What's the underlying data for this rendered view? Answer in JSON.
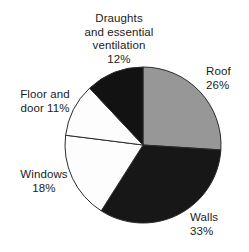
{
  "chart_data": {
    "type": "pie",
    "title": "",
    "subtitle": "",
    "xlabel": "",
    "ylabel": "",
    "legend_position": "none",
    "grid": false,
    "units": "%",
    "start_angle_deg": 0,
    "direction": "clockwise",
    "total": 100,
    "categories": [
      "Roof",
      "Walls",
      "Windows",
      "Floor and door",
      "Draughts and essential ventilation"
    ],
    "values": [
      26,
      33,
      18,
      11,
      12
    ],
    "slices": [
      {
        "name": "Roof",
        "value": 26,
        "value_text": "26%",
        "label_lines": [
          "Roof",
          "26%"
        ],
        "fill": "#979797",
        "stroke": "#2b2b2b",
        "start_deg": 0,
        "end_deg": 93.6
      },
      {
        "name": "Walls",
        "value": 33,
        "value_text": "33%",
        "label_lines": [
          "Walls",
          "33%"
        ],
        "fill": "#171717",
        "stroke": "#2b2b2b",
        "start_deg": 93.6,
        "end_deg": 212.4
      },
      {
        "name": "Windows",
        "value": 18,
        "value_text": "18%",
        "label_lines": [
          "Windows",
          "18%"
        ],
        "fill": "#fdfdfd",
        "stroke": "#2b2b2b",
        "start_deg": 212.4,
        "end_deg": 277.2
      },
      {
        "name": "Floor and door",
        "value": 11,
        "value_text": "11%",
        "label_lines": [
          "Floor and",
          "door 11%"
        ],
        "fill": "#fdfdfd",
        "stroke": "#2b2b2b",
        "start_deg": 277.2,
        "end_deg": 316.8
      },
      {
        "name": "Draughts and essential ventilation",
        "value": 12,
        "value_text": "12%",
        "label_lines": [
          "Draughts",
          "and essential",
          "ventilation",
          "12%"
        ],
        "fill": "#121212",
        "stroke": "#2b2b2b",
        "start_deg": 316.8,
        "end_deg": 360
      }
    ]
  },
  "labels": {
    "roof": {
      "line1": "Roof",
      "line2": "26%"
    },
    "walls": {
      "line1": "Walls",
      "line2": "33%"
    },
    "windows": {
      "line1": "Windows",
      "line2": "18%"
    },
    "floor": {
      "line1": "Floor and",
      "line2": "door 11%"
    },
    "draughts": {
      "line1": "Draughts",
      "line2": "and essential",
      "line3": "ventilation",
      "line4": "12%"
    }
  },
  "colors": {
    "background": "#ffffff",
    "text": "#1b1b1b",
    "roof_gray": "#979797",
    "walls_black": "#171717",
    "draughts_black": "#121212",
    "white_slice": "#fdfdfd",
    "outline": "#2b2b2b"
  },
  "geometry": {
    "center_x": 143,
    "center_y": 145,
    "radius": 78
  }
}
